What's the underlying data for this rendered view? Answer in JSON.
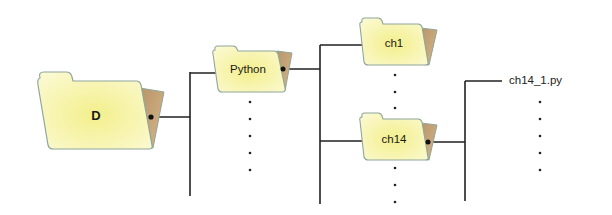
{
  "diagram": {
    "type": "directory-tree",
    "colors": {
      "folder_fill": "#f6f3a2",
      "folder_fill_light": "#fbfad0",
      "folder_stroke": "#8fa69b",
      "folder_back": "#c8a676",
      "line": "#222222",
      "text": "#1a1a1a"
    },
    "nodes": {
      "root": {
        "label": "D"
      },
      "python": {
        "label": "Python"
      },
      "ch1": {
        "label": "ch1"
      },
      "ch14": {
        "label": "ch14"
      },
      "file": {
        "label": "ch14_1.py"
      }
    },
    "ellipsis": "⋮"
  }
}
